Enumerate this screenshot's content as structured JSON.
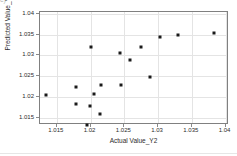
{
  "figure": {
    "caption_fragment": "c)",
    "background_color": "#ffffff",
    "marker_color": "#1a1a1a",
    "axis_color": "#808080",
    "grid_color": "#e4e4e4"
  },
  "chart_data": {
    "type": "scatter",
    "title": "",
    "xlabel": "Actual Value_Y2",
    "ylabel": "Predicted Value_Y2",
    "xlim": [
      1.0125,
      1.0405
    ],
    "ylim": [
      1.0132,
      1.0405
    ],
    "xticks": [
      1.015,
      1.02,
      1.025,
      1.03,
      1.035,
      1.04
    ],
    "xtick_labels": [
      "1.015",
      "1.02",
      "1.025",
      "1.03",
      "1.035",
      "1.04"
    ],
    "yticks": [
      1.015,
      1.02,
      1.025,
      1.03,
      1.035,
      1.04
    ],
    "ytick_labels": [
      "1.015",
      "1.02",
      "1.025",
      "1.03",
      "1.035",
      "1.04"
    ],
    "grid": true,
    "legend": null,
    "marker": "square",
    "x": [
      1.0134,
      1.0178,
      1.0178,
      1.0195,
      1.0199,
      1.0201,
      1.0205,
      1.0214,
      1.0216,
      1.0244,
      1.0245,
      1.0258,
      1.0275,
      1.0288,
      1.0303,
      1.0329,
      1.0383
    ],
    "y": [
      1.0205,
      1.0223,
      1.0182,
      1.0133,
      1.0178,
      1.032,
      1.0206,
      1.0159,
      1.0228,
      1.0307,
      1.0228,
      1.0289,
      1.0321,
      1.0249,
      1.0344,
      1.035,
      1.0354
    ],
    "points": [
      {
        "x": 1.0134,
        "y": 1.0205
      },
      {
        "x": 1.0178,
        "y": 1.0223
      },
      {
        "x": 1.0178,
        "y": 1.0182
      },
      {
        "x": 1.0195,
        "y": 1.0133
      },
      {
        "x": 1.0199,
        "y": 1.0178
      },
      {
        "x": 1.0201,
        "y": 1.032
      },
      {
        "x": 1.0205,
        "y": 1.0206
      },
      {
        "x": 1.0214,
        "y": 1.0159
      },
      {
        "x": 1.0216,
        "y": 1.0228
      },
      {
        "x": 1.0244,
        "y": 1.0307
      },
      {
        "x": 1.0245,
        "y": 1.0228
      },
      {
        "x": 1.0258,
        "y": 1.0289
      },
      {
        "x": 1.0275,
        "y": 1.0321
      },
      {
        "x": 1.0288,
        "y": 1.0249
      },
      {
        "x": 1.0303,
        "y": 1.0344
      },
      {
        "x": 1.0329,
        "y": 1.035
      },
      {
        "x": 1.0383,
        "y": 1.0354
      }
    ]
  }
}
